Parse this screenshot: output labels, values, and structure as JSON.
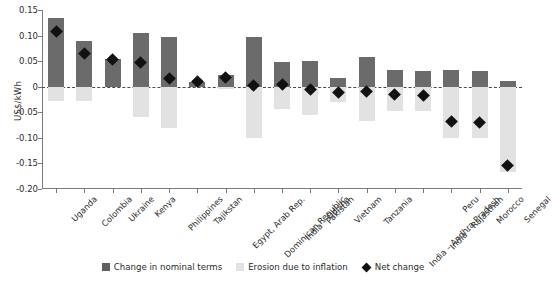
{
  "chart_data": {
    "type": "bar",
    "title": "",
    "xlabel": "",
    "ylabel": "US$/kWh",
    "ylim": [
      -0.2,
      0.15
    ],
    "yticks": [
      "0.15",
      "0.10",
      "0.05",
      "0",
      "-0.05",
      "-0.10",
      "-0.15",
      "-0.20"
    ],
    "ytick_values": [
      0.15,
      0.1,
      0.05,
      0,
      -0.05,
      -0.1,
      -0.15,
      -0.2
    ],
    "grid": false,
    "legend_position": "bottom",
    "categories": [
      "Uganda",
      "Colombia",
      "Ukraine",
      "Kenya",
      "Philippines",
      "Tajikstan",
      "Egypt, Arab Rep.",
      "Dominican Republic",
      "India – Odisha",
      "Pakistan",
      "Vietnam",
      "Tanzania",
      "India – Andhra Pradesh",
      "India – Rajasthan",
      "Peru",
      "Morocco",
      "Senegal"
    ],
    "series": [
      {
        "name": "Change in nominal terms",
        "color": "#6b6b6b",
        "values": [
          0.135,
          0.09,
          0.055,
          0.105,
          0.098,
          0.01,
          0.022,
          0.098,
          0.048,
          0.05,
          0.018,
          0.058,
          0.033,
          0.03,
          0.033,
          0.03,
          0.012
        ]
      },
      {
        "name": "Erosion due to inflation",
        "color": "#e2e2e2",
        "values": [
          -0.027,
          -0.027,
          0.0,
          -0.059,
          -0.081,
          0.0,
          -0.005,
          -0.101,
          -0.043,
          -0.055,
          -0.03,
          -0.068,
          -0.048,
          -0.048,
          -0.1,
          -0.1,
          -0.167
        ]
      },
      {
        "name": "Net change",
        "color": "#111111",
        "marker": "diamond",
        "values": [
          0.108,
          0.065,
          0.053,
          0.047,
          0.017,
          0.01,
          0.018,
          0.003,
          0.005,
          -0.005,
          -0.012,
          -0.01,
          -0.015,
          -0.018,
          -0.068,
          -0.07,
          -0.155
        ]
      }
    ]
  },
  "legend": {
    "items": [
      {
        "label": "Change in nominal terms",
        "swatch": "dark-square-swatch"
      },
      {
        "label": "Erosion due to inflation",
        "swatch": "light-square-swatch"
      },
      {
        "label": "Net change",
        "swatch": "diamond-marker-swatch"
      }
    ]
  }
}
